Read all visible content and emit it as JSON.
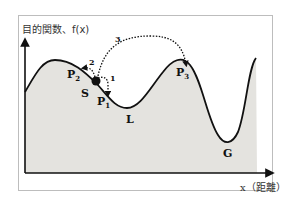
{
  "diagram": {
    "y_axis_label": "目的関数、f(x)",
    "x_axis_label": "x（距離）",
    "points": [
      {
        "id": "P1",
        "letter": "P",
        "sub": "1"
      },
      {
        "id": "P2",
        "letter": "P",
        "sub": "2"
      },
      {
        "id": "P3",
        "letter": "P",
        "sub": "3"
      },
      {
        "id": "S",
        "letter": "S"
      },
      {
        "id": "L",
        "letter": "L"
      },
      {
        "id": "G",
        "letter": "G"
      }
    ],
    "moves": [
      {
        "label": "1",
        "from": "S",
        "to": "P1"
      },
      {
        "label": "2",
        "from": "S",
        "to": "P2"
      },
      {
        "label": "3",
        "from": "S",
        "to": "P3"
      }
    ],
    "colors": {
      "fill": "#e4e3df",
      "curve": "#111111",
      "frame": "#bdbdbd"
    }
  }
}
